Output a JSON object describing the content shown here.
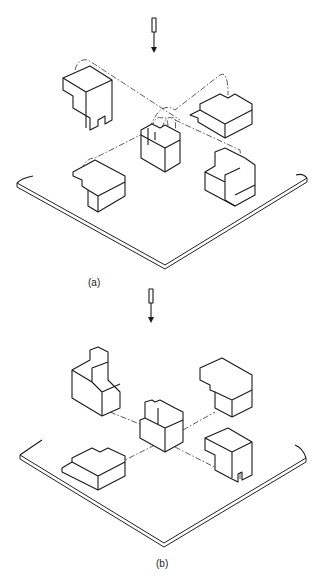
{
  "figures": [
    {
      "id": "a",
      "label": "(a)",
      "view_arrow": "viewing-direction-arrow-down",
      "description": "Isometric view of an object with four orthographic-direction blocks projected onto the horizontal plane, dash-dot projection lines with arrows folding views up"
    },
    {
      "id": "b",
      "label": "(b)",
      "view_arrow": "viewing-direction-arrow-down",
      "description": "Isometric view of the central object with four surrounding rotated blocks on the horizontal plane connected by dash-dot center lines, arrows showing rotation"
    }
  ],
  "colors": {
    "line": "#1a1a1a",
    "background": "#ffffff"
  }
}
